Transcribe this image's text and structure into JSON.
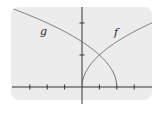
{
  "chart_data": {
    "type": "line",
    "title": "",
    "xlabel": "",
    "ylabel": "",
    "grid": false,
    "legend": "none",
    "xlim": [
      -4,
      4
    ],
    "ylim": [
      -1,
      5
    ],
    "x_ticks": [
      -3,
      -2,
      -1,
      1,
      2,
      3
    ],
    "y_ticks": [
      2,
      4
    ],
    "tick_labels_shown": false,
    "series": [
      {
        "name": "f",
        "formula": "2*sqrt(x)",
        "x": [
          0,
          0.25,
          0.5,
          1,
          1.5,
          2,
          2.5,
          3,
          3.5,
          4
        ],
        "y": [
          0,
          1.0,
          1.41,
          2.0,
          2.45,
          2.83,
          3.16,
          3.46,
          3.74,
          4.0
        ],
        "color": "#6e6e6e"
      },
      {
        "name": "g",
        "formula": "2*sqrt(2-x)",
        "x": [
          -3.9,
          -3,
          -2,
          -1,
          0,
          1,
          1.5,
          1.8,
          2
        ],
        "y": [
          4.86,
          4.47,
          4.0,
          3.46,
          2.83,
          2.0,
          1.41,
          0.89,
          0
        ],
        "color": "#6e6e6e"
      }
    ],
    "annotations": [
      {
        "text": "g",
        "x": -2.5,
        "y": 3.6
      },
      {
        "text": "f",
        "x": 2.3,
        "y": 3.6
      }
    ]
  },
  "labels": {
    "f": "f",
    "g": "g"
  },
  "colors": {
    "panel": "#ececec",
    "axis": "#333333",
    "curve": "#6e6e6e"
  }
}
